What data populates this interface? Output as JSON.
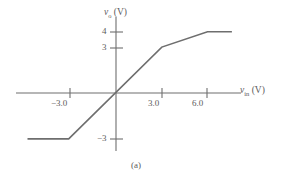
{
  "figure": {
    "caption": "(a)",
    "axis_color": "#6e6e6e",
    "curve_color": "#6e6e6e",
    "background": "#ffffff"
  },
  "chart_data": {
    "type": "line",
    "title": "",
    "subtitle": "",
    "xlabel": "v_in (V)",
    "ylabel": "v_o (V)",
    "xlabel_parts": {
      "symbol": "v",
      "subscript": "in",
      "unit": "(V)"
    },
    "ylabel_parts": {
      "symbol": "v",
      "subscript": "o",
      "unit": "(V)"
    },
    "grid": false,
    "legend": null,
    "xlim": [
      -6.6,
      8.1
    ],
    "ylim": [
      -4.4,
      5.0
    ],
    "xticks": [
      -3.0,
      3.0,
      6.0
    ],
    "xtick_labels": [
      "−3.0",
      "3.0",
      "6.0"
    ],
    "yticks": [
      -3,
      3,
      4
    ],
    "ytick_labels": [
      "−3",
      "3",
      "4"
    ],
    "series": [
      {
        "name": "transfer characteristic",
        "x": [
          -5.8,
          -3.1,
          3.0,
          6.0,
          7.6
        ],
        "y": [
          -3.0,
          -3.0,
          3.0,
          4.0,
          4.0
        ]
      }
    ],
    "annotations": [
      {
        "text": "saturation at −3 V for v_in ≤ −3.1 V"
      },
      {
        "text": "linear region slope ≈ 1 between −3.1 V and 3.0 V"
      },
      {
        "text": "knee at (3.0, 3)"
      },
      {
        "text": "knee at (6.0, 4)"
      },
      {
        "text": "saturation at 4 V for v_in ≥ 6.0 V"
      }
    ]
  }
}
